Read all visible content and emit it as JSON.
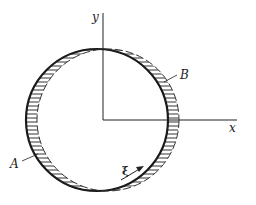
{
  "figure": {
    "type": "cross-section diagram of a thin-walled circular tube with eccentric bore (variable wall thickness)",
    "axes": {
      "x_label": "x",
      "y_label": "y"
    },
    "points": [
      {
        "label": "A",
        "description": "point on left (thicker) wall"
      },
      {
        "label": "B",
        "description": "point on right (thinner) wall"
      }
    ],
    "coordinate": {
      "label": "ξ",
      "description": "arc-length coordinate along wall, arrow indicates direction"
    },
    "colors": {
      "line": "#1a1a1a",
      "hatch": "#333333",
      "background": "#ffffff"
    }
  }
}
